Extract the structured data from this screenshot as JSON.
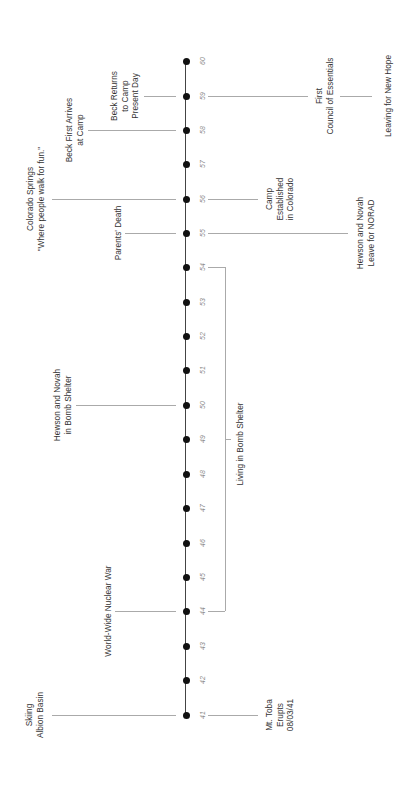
{
  "timeline": {
    "axis": {
      "x": 186,
      "y_start": 61,
      "y_end": 715,
      "color": "#444444"
    },
    "ticks": [
      {
        "label": "41",
        "y": 715
      },
      {
        "label": "42",
        "y": 680
      },
      {
        "label": "43",
        "y": 646
      },
      {
        "label": "44",
        "y": 611
      },
      {
        "label": "45",
        "y": 577
      },
      {
        "label": "46",
        "y": 543
      },
      {
        "label": "47",
        "y": 508
      },
      {
        "label": "48",
        "y": 474
      },
      {
        "label": "49",
        "y": 439
      },
      {
        "label": "50",
        "y": 405
      },
      {
        "label": "51",
        "y": 370
      },
      {
        "label": "52",
        "y": 336
      },
      {
        "label": "53",
        "y": 302
      },
      {
        "label": "54",
        "y": 267
      },
      {
        "label": "55",
        "y": 233
      },
      {
        "label": "56",
        "y": 199
      },
      {
        "label": "57",
        "y": 164
      },
      {
        "label": "58",
        "y": 130
      },
      {
        "label": "59",
        "y": 96
      },
      {
        "label": "60",
        "y": 61
      }
    ],
    "events_left": [
      {
        "text": "Skiing\nAlbion Basin",
        "year": "41",
        "y": 715,
        "line_from": 52,
        "line_to": 176,
        "text_x": 35
      },
      {
        "text": "World-Wide Nuclear War",
        "year": "44",
        "y": 611,
        "line_from": 115,
        "line_to": 176,
        "text_x": 108
      },
      {
        "text": "Hewson and Novah\nin Bomb Shelter",
        "year": "50",
        "y": 405,
        "line_from": 76,
        "line_to": 176,
        "text_x": 63
      },
      {
        "text": "Parents' Death",
        "year": "55",
        "y": 233,
        "line_from": 125,
        "line_to": 176,
        "text_x": 118
      },
      {
        "text": "Colorado Springs\n\"Where people walk for fun.\"",
        "year": "56",
        "y": 199,
        "line_from": 52,
        "line_to": 176,
        "text_x": 36
      },
      {
        "text": "Beck First Arrives\nat Camp",
        "year": "58",
        "y": 130,
        "line_from": 88,
        "line_to": 176,
        "text_x": 75
      },
      {
        "text": "Beck Returns\nto Camp\nPresent Day",
        "year": "59",
        "y": 96,
        "line_from": 144,
        "line_to": 176,
        "text_x": 125
      }
    ],
    "events_right": [
      {
        "text": "Mt. Toba\nErupts\n08/03/41",
        "year": "41",
        "y": 715,
        "line_from": 208,
        "line_to": 258,
        "text_x": 280
      },
      {
        "text": "Hewson and Novah\nLeave for NORAD",
        "year": "55",
        "y": 233,
        "line_from": 208,
        "line_to": 348,
        "text_x": 366
      },
      {
        "text": "Camp\nEstablished\nin Colorado",
        "year": "56",
        "y": 199,
        "line_from": 208,
        "line_to": 258,
        "text_x": 280
      },
      {
        "text": "First\nCouncil of Essentials",
        "year": "59",
        "y": 96,
        "line_from": 208,
        "line_to": 308,
        "text_x": 325
      },
      {
        "text": "Leaving for New Hope",
        "year": "59",
        "y": 96,
        "line_from": 340,
        "line_to": 372,
        "text_x": 388
      }
    ],
    "span": {
      "text": "Living in Bomb Shelter",
      "from_year": "44",
      "to_year": "54",
      "y_top": 267,
      "y_bottom": 611,
      "x": 225,
      "stub_from": 208,
      "mid_y": 439,
      "text_x": 240,
      "text_y": 444
    }
  }
}
